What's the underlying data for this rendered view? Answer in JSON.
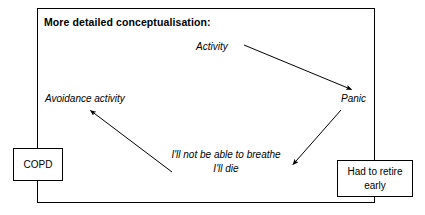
{
  "diagram": {
    "type": "cognitive-behavioural-formulation",
    "title": "More detailed conceptualisation:",
    "background_color": "#ffffff",
    "line_color": "#000000",
    "text_color": "#000000",
    "nodes": {
      "activity": {
        "label": "Activity",
        "style": "italic-plain"
      },
      "panic": {
        "label": "Panic",
        "style": "italic-plain"
      },
      "avoidance": {
        "label": "Avoidance activity",
        "style": "italic-plain"
      },
      "thought": {
        "line1": "I'll not be able to breathe",
        "line2": "I'll die",
        "style": "italic-plain"
      },
      "copd": {
        "label": "COPD",
        "style": "boxed"
      },
      "retire": {
        "line1": "Had to retire",
        "line2": "early",
        "style": "boxed"
      }
    },
    "arrows": [
      {
        "name": "activity-to-panic",
        "from": "activity",
        "to": "panic"
      },
      {
        "name": "panic-to-thought",
        "from": "panic",
        "to": "thought"
      },
      {
        "name": "thought-to-avoidance",
        "from": "thought",
        "to": "avoidance"
      }
    ]
  }
}
